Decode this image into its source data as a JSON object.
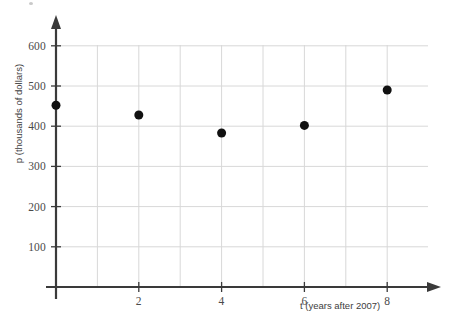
{
  "chart_data": {
    "type": "scatter",
    "title": "",
    "subtitle": "",
    "xlabel": "t (years after 2007)",
    "ylabel": "p (thousands of dollars)",
    "xlim": [
      0,
      9
    ],
    "ylim": [
      0,
      650
    ],
    "grid": true,
    "legend_position": "none",
    "x_tick_labels": [
      "2",
      "4",
      "6",
      "8"
    ],
    "x_tick_values": [
      2,
      4,
      6,
      8
    ],
    "y_tick_labels": [
      "100",
      "200",
      "300",
      "400",
      "500",
      "600"
    ],
    "y_tick_values": [
      100,
      200,
      300,
      400,
      500,
      600
    ],
    "x_gridlines": [
      1,
      2,
      3,
      4,
      5,
      6,
      7,
      8,
      9
    ],
    "y_gridlines": [
      100,
      200,
      300,
      400,
      500,
      600
    ],
    "series": [
      {
        "name": "p",
        "marker": "filled-circle",
        "marker_color": "#111111",
        "marker_size": 9,
        "points": [
          {
            "x": 0,
            "y": 452
          },
          {
            "x": 2,
            "y": 428
          },
          {
            "x": 4,
            "y": 383
          },
          {
            "x": 6,
            "y": 402
          },
          {
            "x": 8,
            "y": 490
          }
        ]
      }
    ],
    "x": [
      0,
      2,
      4,
      6,
      8
    ],
    "values": [
      452,
      428,
      383,
      402,
      490
    ],
    "axis_color": "#3a3a3a",
    "grid_color": "#d8d8d8",
    "background_color": "#ffffff",
    "axis_style": "arrows"
  },
  "axes": {
    "y_axis_title": "p (thousands of dollars)",
    "x_axis_title": "t (years after 2007)"
  }
}
